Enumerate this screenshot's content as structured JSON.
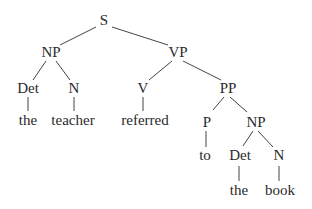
{
  "diagram": {
    "type": "syntax-tree",
    "nodes": [
      {
        "id": "S",
        "label": "S",
        "x": 104,
        "y": 25
      },
      {
        "id": "NP1",
        "label": "NP",
        "x": 51,
        "y": 57
      },
      {
        "id": "VP",
        "label": "VP",
        "x": 178,
        "y": 57
      },
      {
        "id": "Det1",
        "label": "Det",
        "x": 28,
        "y": 93
      },
      {
        "id": "N1",
        "label": "N",
        "x": 74,
        "y": 93
      },
      {
        "id": "V",
        "label": "V",
        "x": 143,
        "y": 93
      },
      {
        "id": "PP",
        "label": "PP",
        "x": 228,
        "y": 93
      },
      {
        "id": "w_the1",
        "label": "the",
        "x": 28,
        "y": 125
      },
      {
        "id": "w_teacher",
        "label": "teacher",
        "x": 73,
        "y": 125
      },
      {
        "id": "w_referred",
        "label": "referred",
        "x": 145,
        "y": 125
      },
      {
        "id": "P",
        "label": "P",
        "x": 207,
        "y": 127
      },
      {
        "id": "NP2",
        "label": "NP",
        "x": 256,
        "y": 127
      },
      {
        "id": "w_to",
        "label": "to",
        "x": 205,
        "y": 160
      },
      {
        "id": "Det2",
        "label": "Det",
        "x": 240,
        "y": 160
      },
      {
        "id": "N2",
        "label": "N",
        "x": 279,
        "y": 160
      },
      {
        "id": "w_the2",
        "label": "the",
        "x": 239,
        "y": 195
      },
      {
        "id": "w_book",
        "label": "book",
        "x": 280,
        "y": 195
      }
    ],
    "edges": [
      {
        "from": [
          96,
          27
        ],
        "to": [
          60,
          45
        ]
      },
      {
        "from": [
          112,
          27
        ],
        "to": [
          168,
          45
        ]
      },
      {
        "from": [
          46,
          61
        ],
        "to": [
          33,
          80
        ]
      },
      {
        "from": [
          56,
          61
        ],
        "to": [
          70,
          80
        ]
      },
      {
        "from": [
          28,
          97
        ],
        "to": [
          28,
          111
        ]
      },
      {
        "from": [
          74,
          97
        ],
        "to": [
          74,
          111
        ]
      },
      {
        "from": [
          172,
          61
        ],
        "to": [
          149,
          80
        ]
      },
      {
        "from": [
          183,
          61
        ],
        "to": [
          221,
          80
        ]
      },
      {
        "from": [
          143,
          97
        ],
        "to": [
          143,
          111
        ]
      },
      {
        "from": [
          224,
          97
        ],
        "to": [
          213,
          110
        ]
      },
      {
        "from": [
          230,
          97
        ],
        "to": [
          247,
          112
        ]
      },
      {
        "from": [
          206,
          131
        ],
        "to": [
          206,
          147
        ]
      },
      {
        "from": [
          253,
          131
        ],
        "to": [
          243,
          146
        ]
      },
      {
        "from": [
          258,
          131
        ],
        "to": [
          273,
          147
        ]
      },
      {
        "from": [
          239,
          166
        ],
        "to": [
          239,
          181
        ]
      },
      {
        "from": [
          279,
          166
        ],
        "to": [
          279,
          181
        ]
      }
    ]
  }
}
